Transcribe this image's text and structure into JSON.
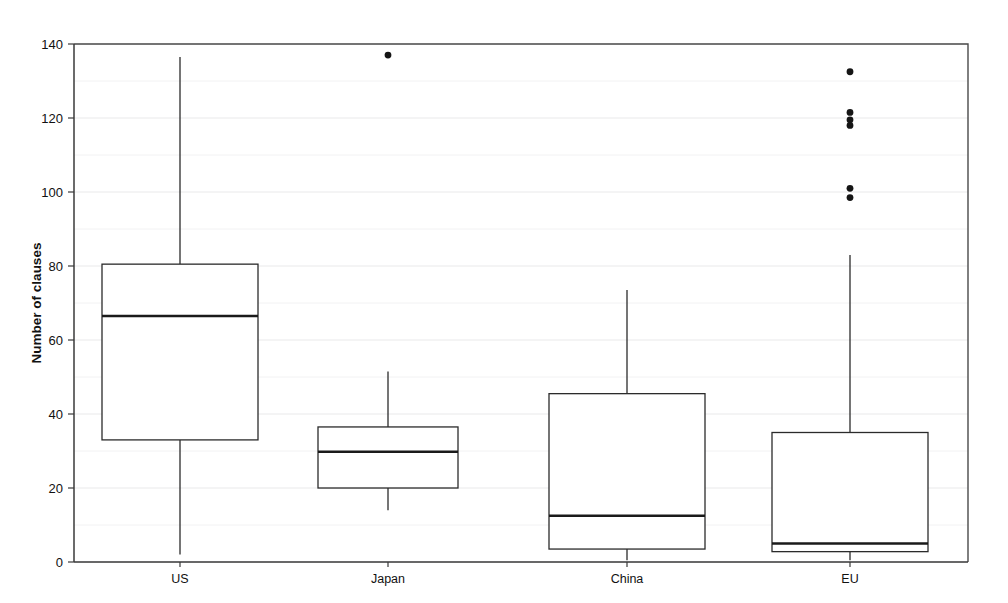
{
  "chart_data": {
    "type": "box",
    "title": "",
    "xlabel": "",
    "ylabel": "Number of clauses",
    "categories": [
      "US",
      "Japan",
      "China",
      "EU"
    ],
    "ylim": [
      0,
      140
    ],
    "yticks": [
      0,
      20,
      40,
      60,
      80,
      100,
      120,
      140
    ],
    "ytick_labels": [
      "0",
      "20",
      "40",
      "60",
      "80",
      "100",
      "120",
      "140"
    ],
    "grid": true,
    "legend": "none",
    "series": [
      {
        "name": "US",
        "whisker_low": 2,
        "q1": 33,
        "median": 66.5,
        "q3": 80.5,
        "whisker_high": 136.5,
        "outliers": []
      },
      {
        "name": "Japan",
        "whisker_low": 14,
        "q1": 20,
        "median": 29.8,
        "q3": 36.5,
        "whisker_high": 51.5,
        "outliers": [
          137
        ]
      },
      {
        "name": "China",
        "whisker_low": 0.5,
        "q1": 3.5,
        "median": 12.5,
        "q3": 45.5,
        "whisker_high": 73.5,
        "outliers": []
      },
      {
        "name": "EU",
        "whisker_low": 0.5,
        "q1": 2.8,
        "median": 5,
        "q3": 35,
        "whisker_high": 83,
        "outliers": [
          132.5,
          121.5,
          119.5,
          118,
          101,
          98.5
        ]
      }
    ]
  },
  "axis": {
    "y_title": "Number of clauses",
    "tick_0": "0",
    "tick_20": "20",
    "tick_40": "40",
    "tick_60": "60",
    "tick_80": "80",
    "tick_100": "100",
    "tick_120": "120",
    "tick_140": "140"
  },
  "categories": {
    "us": "US",
    "japan": "Japan",
    "china": "China",
    "eu": "EU"
  },
  "colors": {
    "box_stroke": "#2b2b2b",
    "median": "#1a1a1a",
    "grid": "#e9e9ea",
    "frame": "#4a4a4a",
    "outlier": "#151515",
    "background": "#ffffff"
  }
}
